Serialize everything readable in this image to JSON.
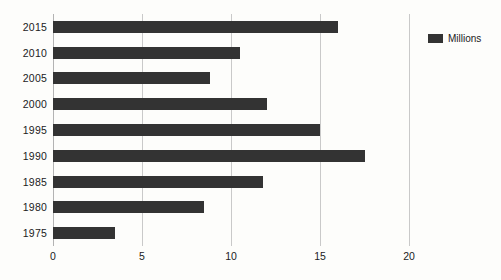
{
  "chart_data": {
    "type": "bar",
    "orientation": "horizontal",
    "title": "",
    "subtitle": "",
    "xlabel": "",
    "ylabel": "",
    "categories": [
      "2015",
      "2010",
      "2005",
      "2000",
      "1995",
      "1990",
      "1985",
      "1980",
      "1975"
    ],
    "series": [
      {
        "name": "Millions",
        "color": "#333333",
        "values": [
          16.0,
          10.5,
          8.8,
          12.0,
          15.0,
          17.5,
          11.8,
          8.5,
          3.5
        ]
      }
    ],
    "xlim": [
      0,
      20
    ],
    "xticks": [
      0,
      5,
      10,
      15,
      20
    ],
    "xtick_labels": [
      "0",
      "5",
      "10",
      "15",
      "20"
    ],
    "grid": "vertical",
    "legend": {
      "position": "right",
      "entries": [
        {
          "label": "Millions",
          "color": "#333333"
        }
      ]
    },
    "background_color": "#fdfdfb",
    "gridline_color": "#c9c9c9"
  }
}
